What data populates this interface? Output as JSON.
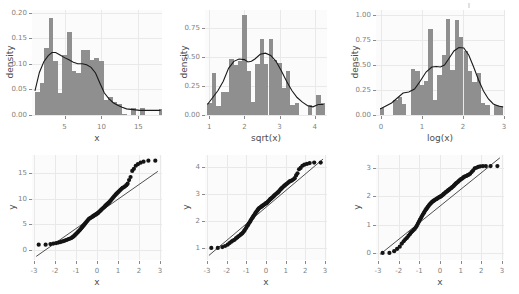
{
  "figure": {
    "title": "",
    "layout": "2 rows x 3 columns",
    "panel_background": "#fbfbfb",
    "bar_color": "#8f8f8f",
    "curve_color": "#1a1a1a",
    "point_color": "#141414",
    "axis_text_color": "#7f7f7f",
    "axis_title_color": "#4d4d4d"
  },
  "chart_data": [
    {
      "id": "hist-x",
      "type": "bar",
      "subtype": "histogram-with-density",
      "title": "",
      "xlabel": "x",
      "ylabel": "density",
      "xlim": [
        0.6,
        18.2
      ],
      "ylim": [
        0.0,
        0.205
      ],
      "xticks": [
        5,
        10,
        15
      ],
      "xticklabels": [
        "5",
        "10",
        "15"
      ],
      "yticks": [
        0.0,
        0.05,
        0.1,
        0.15,
        0.2
      ],
      "yticklabels": [
        "0.00",
        "0.05",
        "0.10",
        "0.15",
        "0.20"
      ],
      "grid": true,
      "legend": "none",
      "bin_width": 0.62,
      "bin_starts": [
        1.0,
        1.62,
        2.24,
        2.86,
        3.48,
        4.1,
        4.72,
        5.34,
        5.96,
        6.58,
        7.2,
        7.82,
        8.44,
        9.06,
        9.68,
        10.3,
        10.92,
        11.54,
        12.16,
        12.78,
        13.4,
        14.02,
        14.64,
        15.26,
        15.88,
        16.5,
        17.12,
        17.74
      ],
      "values": [
        0.045,
        0.062,
        0.13,
        0.19,
        0.105,
        0.042,
        0.118,
        0.163,
        0.085,
        0.082,
        0.127,
        0.127,
        0.107,
        0.112,
        0.105,
        0.03,
        0.036,
        0.025,
        0.022,
        0.002,
        0.0,
        0.014,
        0.0,
        0.013,
        0.0,
        0.0,
        0.0,
        0.012
      ],
      "density_curve": {
        "x": [
          1.0,
          1.6,
          2.2,
          2.8,
          3.3,
          3.8,
          4.4,
          5.0,
          5.6,
          6.2,
          6.8,
          7.4,
          8.0,
          8.6,
          9.2,
          9.8,
          10.4,
          11.0,
          11.6,
          12.2,
          12.8,
          13.4,
          14.0,
          14.6,
          15.2,
          16.0,
          17.0,
          18.0
        ],
        "y": [
          0.047,
          0.083,
          0.104,
          0.116,
          0.122,
          0.122,
          0.117,
          0.112,
          0.108,
          0.103,
          0.1,
          0.1,
          0.098,
          0.093,
          0.082,
          0.062,
          0.043,
          0.032,
          0.024,
          0.019,
          0.015,
          0.012,
          0.011,
          0.01,
          0.009,
          0.009,
          0.009,
          0.009
        ]
      }
    },
    {
      "id": "hist-sqrt-x",
      "type": "bar",
      "subtype": "histogram-with-density",
      "title": "",
      "xlabel": "sqrt(x)",
      "ylabel": "density",
      "xlim": [
        0.88,
        4.35
      ],
      "ylim": [
        0.0,
        0.9
      ],
      "xticks": [
        1,
        2,
        3,
        4
      ],
      "xticklabels": [
        "1",
        "2",
        "3",
        "4"
      ],
      "yticks": [
        0.0,
        0.25,
        0.5,
        0.75
      ],
      "yticklabels": [
        "0.00",
        "0.25",
        "0.50",
        "0.75"
      ],
      "grid": true,
      "legend": "none",
      "bin_width": 0.124,
      "bin_starts": [
        0.95,
        1.074,
        1.198,
        1.322,
        1.446,
        1.57,
        1.694,
        1.818,
        1.942,
        2.066,
        2.19,
        2.314,
        2.438,
        2.562,
        2.686,
        2.81,
        2.934,
        3.058,
        3.182,
        3.306,
        3.43,
        3.554,
        3.678,
        3.802,
        3.926,
        4.05,
        4.174
      ],
      "values": [
        0.1,
        0.36,
        0.08,
        0.2,
        0.2,
        0.48,
        0.43,
        0.46,
        0.86,
        0.38,
        0.11,
        0.44,
        0.65,
        0.44,
        0.65,
        0.47,
        0.45,
        0.23,
        0.38,
        0.09,
        0.1,
        0.0,
        0.0,
        0.09,
        0.0,
        0.17,
        0.1
      ],
      "density_curve": {
        "x": [
          0.95,
          1.1,
          1.25,
          1.4,
          1.55,
          1.7,
          1.85,
          2.0,
          2.1,
          2.2,
          2.3,
          2.45,
          2.6,
          2.75,
          2.9,
          3.05,
          3.2,
          3.35,
          3.5,
          3.65,
          3.8,
          3.95,
          4.1,
          4.25
        ],
        "y": [
          0.09,
          0.15,
          0.21,
          0.29,
          0.4,
          0.46,
          0.48,
          0.475,
          0.455,
          0.46,
          0.48,
          0.52,
          0.53,
          0.51,
          0.46,
          0.38,
          0.29,
          0.21,
          0.15,
          0.11,
          0.08,
          0.07,
          0.09,
          0.09
        ]
      }
    },
    {
      "id": "hist-log-x",
      "type": "bar",
      "subtype": "histogram-with-density",
      "title": "",
      "xlabel": "log(x)",
      "ylabel": "density",
      "xlim": [
        -0.12,
        3.0
      ],
      "ylim": [
        0.0,
        1.05
      ],
      "xticks": [
        0,
        1,
        2,
        3
      ],
      "xticklabels": [
        "0",
        "1",
        "2",
        "3"
      ],
      "yticks": [
        0.0,
        0.25,
        0.5,
        0.75,
        1.0
      ],
      "yticklabels": [
        "0.00",
        "0.25",
        "0.50",
        "0.75",
        "1.00"
      ],
      "grid": true,
      "legend": "none",
      "bin_width": 0.107,
      "bin_starts": [
        -0.02,
        0.087,
        0.194,
        0.301,
        0.408,
        0.515,
        0.622,
        0.729,
        0.836,
        0.943,
        1.05,
        1.157,
        1.264,
        1.371,
        1.478,
        1.585,
        1.692,
        1.799,
        1.906,
        2.013,
        2.12,
        2.227,
        2.334,
        2.441,
        2.548,
        2.655,
        2.762,
        2.869
      ],
      "values": [
        0.07,
        0.0,
        0.0,
        0.15,
        0.18,
        0.11,
        0.0,
        0.46,
        0.44,
        0.3,
        0.34,
        0.86,
        0.15,
        0.4,
        0.6,
        0.96,
        0.45,
        0.95,
        0.78,
        0.64,
        0.44,
        0.33,
        0.42,
        0.12,
        0.1,
        0.0,
        0.1,
        0.09
      ],
      "density_curve": {
        "x": [
          -0.02,
          0.12,
          0.26,
          0.4,
          0.54,
          0.68,
          0.82,
          0.96,
          1.1,
          1.24,
          1.35,
          1.45,
          1.55,
          1.65,
          1.78,
          1.9,
          2.02,
          2.14,
          2.26,
          2.38,
          2.5,
          2.62,
          2.74,
          2.86,
          2.98
        ],
        "y": [
          0.06,
          0.09,
          0.12,
          0.17,
          0.22,
          0.23,
          0.26,
          0.34,
          0.43,
          0.48,
          0.485,
          0.48,
          0.5,
          0.56,
          0.64,
          0.675,
          0.67,
          0.6,
          0.48,
          0.35,
          0.24,
          0.16,
          0.11,
          0.09,
          0.08
        ]
      }
    },
    {
      "id": "qq-x",
      "type": "scatter",
      "subtype": "normal-qq-plot",
      "title": "",
      "xlabel": "x",
      "ylabel": "y",
      "xlim": [
        -3.1,
        3.1
      ],
      "ylim": [
        -2.0,
        18.5
      ],
      "xticks": [
        -3,
        -2,
        -1,
        0,
        1,
        2,
        3
      ],
      "xticklabels": [
        "-3",
        "-2",
        "-1",
        "0",
        "1",
        "2",
        "3"
      ],
      "yticks": [
        0,
        5,
        10,
        15
      ],
      "yticklabels": [
        "0",
        "5",
        "10",
        "15"
      ],
      "grid": true,
      "legend": "none",
      "reference_line": {
        "x": [
          -2.9,
          2.9
        ],
        "y": [
          -1.3,
          15.3
        ]
      },
      "points_x": [
        -2.78,
        -2.45,
        -2.22,
        -2.08,
        -1.95,
        -1.85,
        -1.76,
        -1.68,
        -1.6,
        -1.53,
        -1.46,
        -1.4,
        -1.34,
        -1.28,
        -1.22,
        -1.17,
        -1.12,
        -1.07,
        -1.02,
        -0.97,
        -0.92,
        -0.88,
        -0.83,
        -0.79,
        -0.75,
        -0.71,
        -0.67,
        -0.63,
        -0.59,
        -0.55,
        -0.51,
        -0.47,
        -0.43,
        -0.39,
        -0.36,
        -0.32,
        -0.28,
        -0.24,
        -0.2,
        -0.17,
        -0.13,
        -0.09,
        -0.05,
        -0.02,
        0.02,
        0.05,
        0.09,
        0.13,
        0.17,
        0.2,
        0.24,
        0.28,
        0.32,
        0.36,
        0.39,
        0.43,
        0.47,
        0.51,
        0.55,
        0.59,
        0.63,
        0.67,
        0.71,
        0.75,
        0.79,
        0.83,
        0.88,
        0.92,
        0.97,
        1.02,
        1.07,
        1.12,
        1.17,
        1.22,
        1.28,
        1.34,
        1.4,
        1.46,
        1.53,
        1.6,
        1.68,
        1.76,
        1.85,
        1.95,
        2.08,
        2.22,
        2.45,
        2.78
      ],
      "points_y": [
        1.0,
        1.0,
        1.1,
        1.2,
        1.3,
        1.4,
        1.5,
        1.6,
        1.7,
        1.8,
        1.9,
        2.0,
        2.1,
        2.2,
        2.3,
        2.45,
        2.6,
        2.8,
        3.0,
        3.2,
        3.4,
        3.6,
        3.8,
        4.0,
        4.2,
        4.4,
        4.6,
        4.8,
        5.0,
        5.2,
        5.4,
        5.6,
        5.8,
        6.0,
        6.1,
        6.2,
        6.3,
        6.4,
        6.5,
        6.6,
        6.7,
        6.8,
        6.9,
        7.0,
        7.1,
        7.2,
        7.35,
        7.5,
        7.65,
        7.8,
        7.95,
        8.1,
        8.25,
        8.4,
        8.55,
        8.7,
        8.85,
        9.0,
        9.15,
        9.3,
        9.5,
        9.7,
        9.9,
        10.1,
        10.3,
        10.5,
        10.7,
        10.9,
        11.1,
        11.3,
        11.5,
        11.7,
        11.9,
        12.1,
        12.2,
        12.4,
        12.6,
        12.9,
        13.6,
        14.2,
        15.4,
        15.8,
        16.4,
        16.7,
        17.0,
        17.2,
        17.4,
        17.4
      ]
    },
    {
      "id": "qq-sqrt-x",
      "type": "scatter",
      "subtype": "normal-qq-plot",
      "title": "",
      "xlabel": "x",
      "ylabel": "y",
      "xlim": [
        -3.1,
        3.1
      ],
      "ylim": [
        0.55,
        4.45
      ],
      "xticks": [
        -3,
        -2,
        -1,
        0,
        1,
        2,
        3
      ],
      "xticklabels": [
        "-3",
        "-2",
        "-1",
        "0",
        "1",
        "2",
        "3"
      ],
      "yticks": [
        1,
        2,
        3,
        4
      ],
      "yticklabels": [
        "1",
        "2",
        "3",
        "4"
      ],
      "grid": true,
      "legend": "none",
      "reference_line": {
        "x": [
          -2.9,
          2.9
        ],
        "y": [
          0.72,
          4.3
        ]
      },
      "points_x": [
        -2.78,
        -2.45,
        -2.22,
        -2.08,
        -1.95,
        -1.85,
        -1.76,
        -1.68,
        -1.6,
        -1.53,
        -1.46,
        -1.4,
        -1.34,
        -1.28,
        -1.22,
        -1.17,
        -1.12,
        -1.07,
        -1.02,
        -0.97,
        -0.92,
        -0.88,
        -0.83,
        -0.79,
        -0.75,
        -0.71,
        -0.67,
        -0.63,
        -0.59,
        -0.55,
        -0.51,
        -0.47,
        -0.43,
        -0.39,
        -0.36,
        -0.32,
        -0.28,
        -0.24,
        -0.2,
        -0.17,
        -0.13,
        -0.09,
        -0.05,
        -0.02,
        0.02,
        0.05,
        0.09,
        0.13,
        0.17,
        0.2,
        0.24,
        0.28,
        0.32,
        0.36,
        0.39,
        0.43,
        0.47,
        0.51,
        0.55,
        0.59,
        0.63,
        0.67,
        0.71,
        0.75,
        0.79,
        0.83,
        0.88,
        0.92,
        0.97,
        1.02,
        1.07,
        1.12,
        1.17,
        1.22,
        1.28,
        1.34,
        1.4,
        1.46,
        1.53,
        1.6,
        1.68,
        1.76,
        1.85,
        1.95,
        2.08,
        2.22,
        2.45,
        2.78
      ],
      "points_y": [
        1.0,
        1.0,
        1.03,
        1.07,
        1.12,
        1.18,
        1.23,
        1.27,
        1.3,
        1.35,
        1.39,
        1.43,
        1.46,
        1.5,
        1.53,
        1.57,
        1.62,
        1.67,
        1.73,
        1.79,
        1.84,
        1.9,
        1.95,
        2.0,
        2.05,
        2.1,
        2.14,
        2.19,
        2.23,
        2.28,
        2.32,
        2.36,
        2.4,
        2.44,
        2.47,
        2.49,
        2.51,
        2.53,
        2.55,
        2.57,
        2.59,
        2.61,
        2.63,
        2.65,
        2.66,
        2.68,
        2.71,
        2.74,
        2.77,
        2.8,
        2.82,
        2.85,
        2.87,
        2.9,
        2.92,
        2.95,
        2.98,
        3.0,
        3.03,
        3.05,
        3.08,
        3.11,
        3.15,
        3.18,
        3.21,
        3.24,
        3.27,
        3.3,
        3.33,
        3.36,
        3.39,
        3.42,
        3.45,
        3.48,
        3.49,
        3.52,
        3.55,
        3.59,
        3.69,
        3.77,
        3.92,
        3.97,
        4.05,
        4.09,
        4.12,
        4.15,
        4.17,
        4.17
      ]
    },
    {
      "id": "qq-log-x",
      "type": "scatter",
      "subtype": "normal-qq-plot",
      "title": "",
      "xlabel": "x",
      "ylabel": "y",
      "xlim": [
        -3.1,
        3.1
      ],
      "ylim": [
        -0.25,
        3.45
      ],
      "xticks": [
        -3,
        -2,
        -1,
        0,
        1,
        2,
        3
      ],
      "xticklabels": [
        "-3",
        "-2",
        "-1",
        "0",
        "1",
        "2",
        "3"
      ],
      "yticks": [
        0,
        1,
        2,
        3
      ],
      "yticklabels": [
        "0",
        "1",
        "2",
        "3"
      ],
      "grid": true,
      "legend": "none",
      "reference_line": {
        "x": [
          -2.9,
          2.9
        ],
        "y": [
          -0.05,
          3.35
        ]
      },
      "points_x": [
        -2.78,
        -2.45,
        -2.22,
        -2.08,
        -1.95,
        -1.85,
        -1.76,
        -1.68,
        -1.6,
        -1.53,
        -1.46,
        -1.4,
        -1.34,
        -1.28,
        -1.22,
        -1.17,
        -1.12,
        -1.07,
        -1.02,
        -0.97,
        -0.92,
        -0.88,
        -0.83,
        -0.79,
        -0.75,
        -0.71,
        -0.67,
        -0.63,
        -0.59,
        -0.55,
        -0.51,
        -0.47,
        -0.43,
        -0.39,
        -0.36,
        -0.32,
        -0.28,
        -0.24,
        -0.2,
        -0.17,
        -0.13,
        -0.09,
        -0.05,
        -0.02,
        0.02,
        0.05,
        0.09,
        0.13,
        0.17,
        0.2,
        0.24,
        0.28,
        0.32,
        0.36,
        0.39,
        0.43,
        0.47,
        0.51,
        0.55,
        0.59,
        0.63,
        0.67,
        0.71,
        0.75,
        0.79,
        0.83,
        0.88,
        0.92,
        0.97,
        1.02,
        1.07,
        1.12,
        1.17,
        1.22,
        1.28,
        1.34,
        1.4,
        1.46,
        1.53,
        1.6,
        1.68,
        1.76,
        1.85,
        1.95,
        2.08,
        2.22,
        2.45,
        2.78
      ],
      "points_y": [
        0.0,
        0.0,
        0.06,
        0.14,
        0.22,
        0.33,
        0.41,
        0.48,
        0.53,
        0.6,
        0.66,
        0.72,
        0.76,
        0.81,
        0.85,
        0.9,
        0.96,
        1.03,
        1.1,
        1.17,
        1.23,
        1.29,
        1.35,
        1.4,
        1.45,
        1.5,
        1.54,
        1.58,
        1.62,
        1.66,
        1.7,
        1.73,
        1.76,
        1.79,
        1.81,
        1.83,
        1.85,
        1.87,
        1.89,
        1.9,
        1.92,
        1.94,
        1.96,
        1.97,
        1.98,
        2.0,
        2.02,
        2.04,
        2.07,
        2.09,
        2.11,
        2.14,
        2.16,
        2.18,
        2.2,
        2.22,
        2.25,
        2.27,
        2.29,
        2.32,
        2.34,
        2.37,
        2.4,
        2.43,
        2.46,
        2.48,
        2.51,
        2.54,
        2.57,
        2.6,
        2.62,
        2.65,
        2.68,
        2.7,
        2.71,
        2.74,
        2.76,
        2.79,
        2.85,
        2.9,
        2.98,
        3.0,
        3.03,
        3.05,
        3.06,
        3.06,
        3.06,
        3.06
      ]
    }
  ]
}
